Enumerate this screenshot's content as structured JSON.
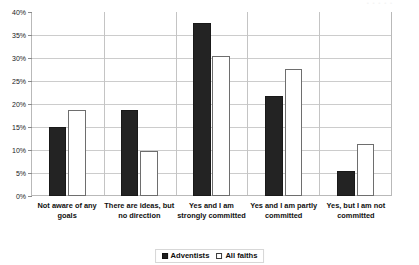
{
  "chart_data": {
    "type": "bar",
    "title": "",
    "xlabel": "",
    "ylabel": "",
    "ylim": [
      0,
      40
    ],
    "ytick_step": 5,
    "ytick_labels": [
      "40%",
      "35%",
      "30%",
      "25%",
      "20%",
      "15%",
      "10%",
      "5%",
      "0%"
    ],
    "ytick_values": [
      40,
      35,
      30,
      25,
      20,
      15,
      10,
      5,
      0
    ],
    "grid": true,
    "legend_position": "bottom-center",
    "categories": [
      "Not aware of any goals",
      "There are ideas, but no direction",
      "Yes and I am strongly committed",
      "Yes and I am partly committed",
      "Yes, but I am not committed"
    ],
    "series": [
      {
        "name": "Adventists",
        "fill": "#232323",
        "style": "filled",
        "values": [
          15.1,
          18.8,
          37.6,
          21.8,
          5.4
        ]
      },
      {
        "name": "All faiths",
        "fill": "#ffffff",
        "style": "hollow",
        "values": [
          18.8,
          9.8,
          30.5,
          27.6,
          11.3
        ]
      }
    ]
  },
  "legend": {
    "items": [
      {
        "label": "Adventists",
        "swatch": "filled-square-icon"
      },
      {
        "label": "All faiths",
        "swatch": "hollow-square-icon"
      }
    ]
  },
  "colors": {
    "adventists": "#232323",
    "all_faiths": "#ffffff",
    "gridline": "#cccccc",
    "axis": "#b9b9b9",
    "background": "#ffffff"
  },
  "artifact": {
    "top_right_text": "• • • • •"
  }
}
